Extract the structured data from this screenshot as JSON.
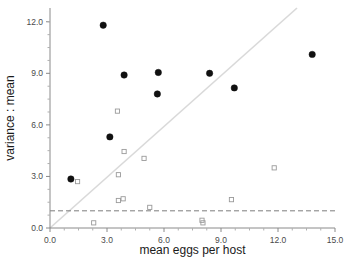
{
  "chart_data": {
    "type": "scatter",
    "title": "",
    "xlabel": "mean eggs per host",
    "ylabel": "variance : mean",
    "xlim": [
      0.0,
      15.0
    ],
    "ylim": [
      0.0,
      12.8
    ],
    "xticks": [
      "0.0",
      "3.0",
      "6.0",
      "9.0",
      "12.0",
      "15.0"
    ],
    "xtick_values": [
      0.0,
      3.0,
      6.0,
      9.0,
      12.0,
      15.0
    ],
    "yticks": [
      "0.0",
      "3.0",
      "6.0",
      "9.0",
      "12.0"
    ],
    "ytick_values": [
      0.0,
      3.0,
      6.0,
      9.0,
      12.0
    ],
    "xminor_values": [
      0.75,
      1.5,
      2.25,
      3.75,
      4.5,
      5.25,
      6.75,
      7.5,
      8.25,
      9.75,
      10.5,
      11.25,
      12.75,
      13.5,
      14.25
    ],
    "yminor_values": [
      0.75,
      1.5,
      2.25,
      3.75,
      4.5,
      5.25,
      6.75,
      7.5,
      8.25,
      9.75,
      10.5,
      11.25,
      12.0
    ],
    "grid": false,
    "legend": "none",
    "series": [
      {
        "name": "filled-circles",
        "marker": "filled-circle",
        "color": "#111111",
        "points": [
          {
            "x": 2.8,
            "y": 11.8
          },
          {
            "x": 3.9,
            "y": 8.9
          },
          {
            "x": 5.7,
            "y": 9.05
          },
          {
            "x": 5.65,
            "y": 7.8
          },
          {
            "x": 8.4,
            "y": 9.0
          },
          {
            "x": 9.7,
            "y": 8.15
          },
          {
            "x": 13.8,
            "y": 10.1
          },
          {
            "x": 3.15,
            "y": 5.3
          },
          {
            "x": 1.1,
            "y": 2.85
          }
        ]
      },
      {
        "name": "open-squares",
        "marker": "open-square",
        "color": "#9a9a9a",
        "points": [
          {
            "x": 3.55,
            "y": 6.8
          },
          {
            "x": 3.9,
            "y": 4.45
          },
          {
            "x": 4.95,
            "y": 4.05
          },
          {
            "x": 3.6,
            "y": 3.1
          },
          {
            "x": 11.8,
            "y": 3.5
          },
          {
            "x": 1.45,
            "y": 2.7
          },
          {
            "x": 3.85,
            "y": 1.7
          },
          {
            "x": 3.6,
            "y": 1.6
          },
          {
            "x": 9.55,
            "y": 1.65
          },
          {
            "x": 5.25,
            "y": 1.2
          },
          {
            "x": 8.0,
            "y": 0.45
          },
          {
            "x": 8.05,
            "y": 0.3
          },
          {
            "x": 2.3,
            "y": 0.3
          }
        ]
      }
    ],
    "reference_lines": [
      {
        "name": "identity-diagonal",
        "style": "solid",
        "color": "#d9d9d9",
        "x0": 0.0,
        "y0": 0.0,
        "x1": 13.0,
        "y1": 12.8
      },
      {
        "name": "unit-variance-ratio",
        "style": "dashed",
        "color": "#7d7d7d",
        "value": 1.0,
        "orientation": "horizontal"
      }
    ]
  }
}
